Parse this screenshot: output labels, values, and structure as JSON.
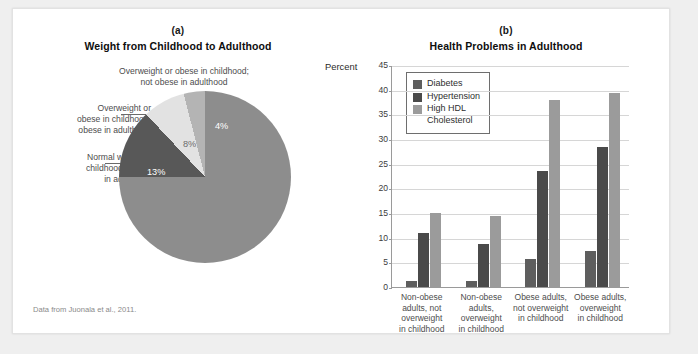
{
  "figure": {
    "source_note": "Data from Juonala et al., 2011."
  },
  "panel_a": {
    "letter": "(a)",
    "title": "Weight from Childhood to Adulthood",
    "callouts": {
      "top": "Overweight or obese in childhood;\nnot obese in adulthood",
      "left_upper": "Overweight or\nobese in childhood;\nobese in adulthood",
      "left_lower": "Normal weight in\nchildhood; obese\nin adulthood",
      "inner": "Normal weight in\nchildhood; not obese in\nadulthood"
    }
  },
  "panel_b": {
    "letter": "(b)",
    "title": "Health Problems in Adulthood",
    "axis_label": "Percent"
  },
  "chart_data": [
    {
      "type": "pie",
      "title": "Weight from Childhood to Adulthood",
      "slices": [
        {
          "label": "Normal weight in childhood; not obese in adulthood",
          "value": 75,
          "display": "75%",
          "color": "#8d8d8d"
        },
        {
          "label": "Normal weight in childhood; obese in adulthood",
          "value": 13,
          "display": "13%",
          "color": "#585858"
        },
        {
          "label": "Overweight or obese in childhood; obese in adulthood",
          "value": 8,
          "display": "8%",
          "color": "#e2e2e2"
        },
        {
          "label": "Overweight or obese in childhood; not obese in adulthood",
          "value": 4,
          "display": "4%",
          "color": "#b4b4b4"
        }
      ],
      "start_angle_deg": 0,
      "direction": "clockwise"
    },
    {
      "type": "bar",
      "title": "Health Problems in Adulthood",
      "xlabel": "",
      "ylabel": "Percent",
      "ylim": [
        0,
        45
      ],
      "yticks": [
        0,
        5,
        10,
        15,
        20,
        25,
        30,
        35,
        40,
        45
      ],
      "grid": true,
      "legend_position": "top-left",
      "categories": [
        "Non-obese\nadults, not\noverweight\nin childhood",
        "Non-obese\nadults,\noverweight\nin childhood",
        "Obese adults,\nnot overweight\nin childhood",
        "Obese adults,\noverweight\nin childhood"
      ],
      "series": [
        {
          "name": "Diabetes",
          "color": "#5e5e5e",
          "values": [
            1.2,
            1.2,
            5.7,
            7.4
          ]
        },
        {
          "name": "Hypertension",
          "color": "#4a4a4a",
          "values": [
            11.0,
            8.8,
            23.5,
            28.3
          ]
        },
        {
          "name": "High HDL\nCholesterol",
          "color": "#9b9b9b",
          "values": [
            15.0,
            14.3,
            38.0,
            39.4
          ]
        }
      ]
    }
  ]
}
